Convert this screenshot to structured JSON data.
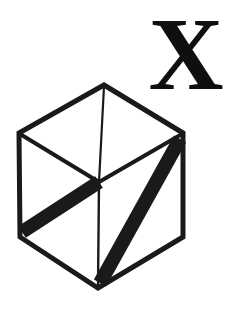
{
  "figure": {
    "label_letter": "X",
    "background_color": "#ffffff",
    "ink_color": "#1a1a1a",
    "letter_color": "#0f0f10",
    "canvas": {
      "width": 231,
      "height": 314
    },
    "geometry": {
      "description": "Isometric cube drawn as a hexagon with three internal edges meeting at the center vertex",
      "vertices": {
        "top": [
          104,
          85
        ],
        "upper_left": [
          19,
          133
        ],
        "upper_right": [
          183,
          133
        ],
        "center": [
          99,
          182
        ],
        "lower_left": [
          20,
          237
        ],
        "lower_right": [
          183,
          237
        ],
        "bottom": [
          98,
          288
        ]
      },
      "outline_edges": [
        [
          "top",
          "upper_left"
        ],
        [
          "top",
          "upper_right"
        ],
        [
          "upper_left",
          "lower_left"
        ],
        [
          "upper_right",
          "lower_right"
        ],
        [
          "lower_left",
          "bottom"
        ],
        [
          "lower_right",
          "bottom"
        ]
      ],
      "inner_edges": [
        {
          "from": "top",
          "to": "center",
          "weight": "thin"
        },
        {
          "from": "upper_left",
          "to": "center",
          "weight": "medium"
        },
        {
          "from": "upper_right",
          "to": "center",
          "weight": "medium"
        },
        {
          "from": "center",
          "to": "bottom",
          "weight": "thin"
        }
      ],
      "thick_bands": [
        {
          "from": "center",
          "to": "lower_left",
          "weight": "thick"
        },
        {
          "from": "bottom",
          "to": "upper_right",
          "weight": "thick"
        }
      ],
      "stroke_widths": {
        "outline": 5,
        "thin": 2,
        "medium": 4,
        "thick": 14
      }
    }
  }
}
